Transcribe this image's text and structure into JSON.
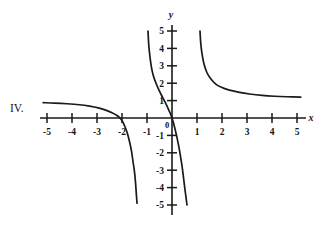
{
  "figure": {
    "label": "IV.",
    "axis_x_name": "x",
    "axis_y_name": "y",
    "origin_label": "0"
  },
  "colors": {
    "ink": "#1a1a1a",
    "background": "#ffffff"
  },
  "chart_data": {
    "type": "line",
    "title": "",
    "subtitle": "",
    "xlabel": "x",
    "ylabel": "y",
    "xlim": [
      -5.3,
      5.3
    ],
    "ylim": [
      -5.3,
      5.3
    ],
    "grid": false,
    "legend": null,
    "annotations": [
      "IV."
    ],
    "x_ticks": [
      -5,
      -4,
      -3,
      -2,
      -1,
      1,
      2,
      3,
      4,
      5
    ],
    "x_tick_labels": [
      "-5",
      "-4",
      "-3",
      "-2",
      "-1",
      "1",
      "2",
      "3",
      "4",
      "5"
    ],
    "y_ticks": [
      -5,
      -4,
      -3,
      -2,
      -1,
      1,
      2,
      3,
      4,
      5
    ],
    "y_tick_labels": [
      "-5",
      "-4",
      "-3",
      "-2",
      "-1",
      "1",
      "2",
      "3",
      "4",
      "5"
    ],
    "series": [
      {
        "name": "branch-upper-right",
        "comment": "decreasing hyperbolic arm in quadrant I, vertical asymptote near x=1.05, horizontal asymptote near y=1",
        "points": [
          [
            1.12,
            5.0
          ],
          [
            1.15,
            4.3
          ],
          [
            1.2,
            3.7
          ],
          [
            1.28,
            3.1
          ],
          [
            1.4,
            2.6
          ],
          [
            1.55,
            2.25
          ],
          [
            1.75,
            1.95
          ],
          [
            2.0,
            1.75
          ],
          [
            2.3,
            1.6
          ],
          [
            2.7,
            1.47
          ],
          [
            3.1,
            1.38
          ],
          [
            3.6,
            1.3
          ],
          [
            4.1,
            1.25
          ],
          [
            4.6,
            1.22
          ],
          [
            5.15,
            1.2
          ]
        ]
      },
      {
        "name": "branch-upper-middle",
        "comment": "steep decreasing arm from y=5 near x=-0.95 down through the origin",
        "points": [
          [
            -0.96,
            5.0
          ],
          [
            -0.93,
            4.2
          ],
          [
            -0.88,
            3.5
          ],
          [
            -0.82,
            2.9
          ],
          [
            -0.74,
            2.4
          ],
          [
            -0.64,
            2.0
          ],
          [
            -0.52,
            1.6
          ],
          [
            -0.4,
            1.25
          ],
          [
            -0.28,
            0.92
          ],
          [
            -0.18,
            0.62
          ],
          [
            -0.08,
            0.3
          ],
          [
            0.0,
            0.0
          ]
        ]
      },
      {
        "name": "branch-lower-middle",
        "comment": "continuation below the origin descending to y=-5 near x=0.6",
        "points": [
          [
            0.0,
            0.0
          ],
          [
            0.07,
            -0.35
          ],
          [
            0.14,
            -0.75
          ],
          [
            0.21,
            -1.2
          ],
          [
            0.28,
            -1.7
          ],
          [
            0.34,
            -2.2
          ],
          [
            0.4,
            -2.75
          ],
          [
            0.45,
            -3.3
          ],
          [
            0.5,
            -3.9
          ],
          [
            0.55,
            -4.45
          ],
          [
            0.6,
            -5.0
          ]
        ]
      },
      {
        "name": "branch-left",
        "comment": "arm in quadrant II falling from y≈0.9 at x=-5, crossing the x-axis near x=-2.1, plunging to y=-5 near x=-1.4",
        "points": [
          [
            -5.15,
            0.88
          ],
          [
            -4.7,
            0.86
          ],
          [
            -4.2,
            0.82
          ],
          [
            -3.7,
            0.76
          ],
          [
            -3.3,
            0.68
          ],
          [
            -2.95,
            0.58
          ],
          [
            -2.65,
            0.45
          ],
          [
            -2.4,
            0.3
          ],
          [
            -2.2,
            0.14
          ],
          [
            -2.08,
            0.0
          ],
          [
            -1.98,
            -0.2
          ],
          [
            -1.88,
            -0.5
          ],
          [
            -1.78,
            -0.9
          ],
          [
            -1.7,
            -1.35
          ],
          [
            -1.62,
            -1.9
          ],
          [
            -1.56,
            -2.5
          ],
          [
            -1.5,
            -3.1
          ],
          [
            -1.46,
            -3.7
          ],
          [
            -1.43,
            -4.3
          ],
          [
            -1.4,
            -4.9
          ]
        ]
      }
    ]
  }
}
